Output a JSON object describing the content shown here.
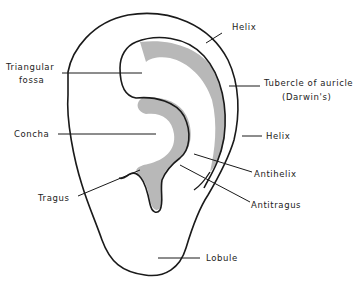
{
  "diagram": {
    "colors": {
      "outline": "#1a1a1a",
      "shading": "#b8b8b8",
      "background": "#ffffff",
      "text": "#222222"
    },
    "labels": {
      "helix_top": "Helix",
      "triangular_fossa_1": "Triangular",
      "triangular_fossa_2": "fossa",
      "tubercle_1": "Tubercle of auricle",
      "tubercle_2": "(Darwin's)",
      "concha": "Concha",
      "helix_mid": "Helix",
      "antihelix": "Antihelix",
      "tragus": "Tragus",
      "antitragus": "Antitragus",
      "lobule": "Lobule"
    }
  }
}
